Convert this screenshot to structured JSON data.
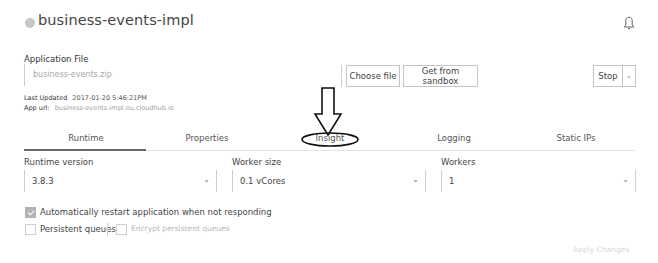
{
  "header": {
    "app_name": "business-events-impl",
    "status_dot_color": "#c8c8c8",
    "notification_icon": "bell-icon"
  },
  "deployment": {
    "application_file_label": "Application File",
    "file_name": "business-events.zip",
    "choose_file_label": "Choose file",
    "get_from_sandbox_label": "Get from sandbox",
    "stop_label": "Stop",
    "stop_menu_icon": "chevron-down-icon",
    "last_updated_label": "Last Updated",
    "last_updated_value": "2017-01-20 5:46:21PM",
    "app_url_label": "App url:",
    "app_url_value": "business-events-impl.eu.cloudhub.io"
  },
  "tabs": [
    {
      "label": "Runtime",
      "active": true
    },
    {
      "label": "Properties",
      "active": false
    },
    {
      "label": "Insight",
      "active": false,
      "annotated": true
    },
    {
      "label": "Logging",
      "active": false
    },
    {
      "label": "Static IPs",
      "active": false
    }
  ],
  "runtime": {
    "runtime_version_label": "Runtime version",
    "runtime_version_value": "3.8.3",
    "worker_size_label": "Worker size",
    "worker_size_value": "0.1 vCores",
    "workers_label": "Workers",
    "workers_value": "1",
    "auto_restart_label": "Automatically restart application when not responding",
    "auto_restart_checked": true,
    "persistent_queues_label": "Persistent queues",
    "persistent_queues_checked": false,
    "encrypt_queues_label": "Encrypt persistent queues",
    "encrypt_queues_checked": false,
    "encrypt_queues_disabled": true,
    "apply_changes_label": "Apply Changes"
  },
  "annotation": {
    "type": "down-arrow-with-ellipse",
    "target": "Insight tab",
    "color": "#111111"
  }
}
